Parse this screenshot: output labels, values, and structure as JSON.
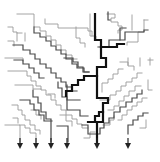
{
  "diagram": {
    "type": "branching-staircase-tree",
    "width": 160,
    "height": 162,
    "colors": {
      "background": "#ffffff",
      "thin": "#9a9a9a",
      "medium": "#4a4a4a",
      "thick": "#111111",
      "arrow": "#222222"
    },
    "paths": [
      {
        "weight": "thin",
        "d": "M17 14 H34 V27 H40 V31 H46 V36 H51 V40 H56 V45 H61 V50 H66 V55 H72 V59 H77"
      },
      {
        "weight": "thin",
        "d": "M45 19 V24 H58 V28 H88 V31 H92 V36"
      },
      {
        "weight": "thin",
        "d": "M90 14 V36 H96 V40"
      },
      {
        "weight": "thin",
        "d": "M107 14 H115 V18 H111 V22 H118 V26 H122 V30 H118 V33"
      },
      {
        "weight": "thin",
        "d": "M132 15 V30"
      },
      {
        "weight": "thin",
        "d": "M144 20 H148 M144 20 V32 H138 V42 H127 V45"
      },
      {
        "weight": "thin",
        "d": "M8 27 H13 V32 H17 V41 M17 33 H22 M25 33 V41"
      },
      {
        "weight": "thin",
        "d": "M8 41 H14 V46"
      },
      {
        "weight": "thin",
        "d": "M76 27 V38 H80 V43 H85 V47"
      },
      {
        "weight": "thin",
        "d": "M5 58 H23 V61"
      },
      {
        "weight": "thin",
        "d": "M8 71 H27 V76 H31 V81 H36 V86 H41 V90 H46 V95 H51 V100 H56 V105 H61 V110 H66 V115 H72 V119 H77 V124 H82 V128 H88"
      },
      {
        "weight": "thin",
        "d": "M15 85 H33 V89 H41"
      },
      {
        "weight": "thin",
        "d": "M12 105 H18 V110 H22 V115 H25 V120 H30 V125 H35 V130 H40 V134"
      },
      {
        "weight": "thin",
        "d": "M13 118 H18 V123"
      },
      {
        "weight": "thin",
        "d": "M31 110 H36 V115 H41 V119"
      },
      {
        "weight": "thin",
        "d": "M20 125 H25 V128 H30 V133 H36 V142"
      },
      {
        "weight": "thin",
        "d": "M48 94 H55 V98"
      },
      {
        "weight": "thin",
        "d": "M60 115 H66 V121 H72 V126"
      },
      {
        "weight": "thin",
        "d": "M5 125 H20 V142"
      },
      {
        "weight": "thin",
        "d": "M100 100 H110 V95 H116 V91 H121 V86 H126 V82 H132 V78 H137 V73 H142"
      },
      {
        "weight": "thin",
        "d": "M108 110 H114 V106 H119 V101 H124 V96 H129 V91 H135 V86 H141"
      },
      {
        "weight": "thin",
        "d": "M118 120 H122 V115 H127 V110 H132 V106 H137 V102 H142 V98 H147"
      },
      {
        "weight": "thin",
        "d": "M128 58 V65 M140 58 V66 M150 58 V65"
      },
      {
        "weight": "thin",
        "d": "M148 60 H153"
      },
      {
        "weight": "thin",
        "d": "M120 62 H128 V66 H134 V70"
      },
      {
        "weight": "thin",
        "d": "M102 92 V83 H108 V79 H113 V74 H118 V69 H123"
      },
      {
        "weight": "thin",
        "d": "M103 125 H110 V120 H114 V116"
      },
      {
        "weight": "thin",
        "d": "M148 80 V90 H152"
      },
      {
        "weight": "thin",
        "d": "M146 120 V128 H140"
      },
      {
        "weight": "thin",
        "d": "M84 138 H90 V132 H95"
      },
      {
        "weight": "medium",
        "d": "M34 27 V33 H40 V37 H46 V41 H51 V46 H56 V50 H61 V54 H66 V59 H72 V64 H77 V68 H84 V72 H89"
      },
      {
        "weight": "medium",
        "d": "M13 45 H23 V50 H30 V54 H35 V59 H40 V64 H46 V68 H51 V73 H56 V78 H61 V82 H66 V87 H72 V91 H77"
      },
      {
        "weight": "medium",
        "d": "M14 60 H23 V64 H29 V68 H34 V73 H39 V78 H44"
      },
      {
        "weight": "medium",
        "d": "M33 90 V97 H38 V103 H41 V112 H46 V119 H51 V142"
      },
      {
        "weight": "medium",
        "d": "M20 100 H30 V104 H34 V110 H39 V115 H44 V121 H52"
      },
      {
        "weight": "medium",
        "d": "M58 82 V88 H62 V97 H67 V110 H80 V116 H88"
      },
      {
        "weight": "medium",
        "d": "M82 125 H88 V134 H97 V142"
      },
      {
        "weight": "medium",
        "d": "M97 134 H100 V128 H104 V123 H109 V118 H114 V112 H120 V107 H126 V102 H132 V98 H137 V94 H142 V90"
      },
      {
        "weight": "medium",
        "d": "M98 47 H109 V40 H125 V32 H144 V30 H148"
      },
      {
        "weight": "medium",
        "d": "M120 40 V28 H126"
      },
      {
        "weight": "medium",
        "d": "M64 58 H73 V62 H78 V67 H83 V72 H89"
      },
      {
        "weight": "medium",
        "d": "M67 85 V99 M67 100 H80"
      },
      {
        "weight": "medium",
        "d": "M128 134 V125 H133 V120 H138 V116 H143 V113 H148"
      },
      {
        "weight": "medium",
        "d": "M57 126 H68 V142"
      },
      {
        "weight": "medium",
        "d": "M108 12 V20 H110"
      },
      {
        "weight": "thick",
        "d": "M95 14 V40 H101 V47 H117 V44 H124"
      },
      {
        "weight": "thick",
        "d": "M101 47 V58 H106 V67 H97 V76 H97 V98 H108 V103 H103 V112 H99 V116 H95 V122 H88"
      },
      {
        "weight": "thick",
        "d": "M97 76 H84 V80 H78 V85 H72 V91 H66 V96"
      },
      {
        "weight": "thick",
        "d": "M103 112 V122 H97 V142"
      }
    ],
    "arrows": [
      {
        "x": 20,
        "y": 142
      },
      {
        "x": 36,
        "y": 142
      },
      {
        "x": 51,
        "y": 142
      },
      {
        "x": 67,
        "y": 142
      },
      {
        "x": 97,
        "y": 142
      },
      {
        "x": 128,
        "y": 142
      }
    ]
  }
}
